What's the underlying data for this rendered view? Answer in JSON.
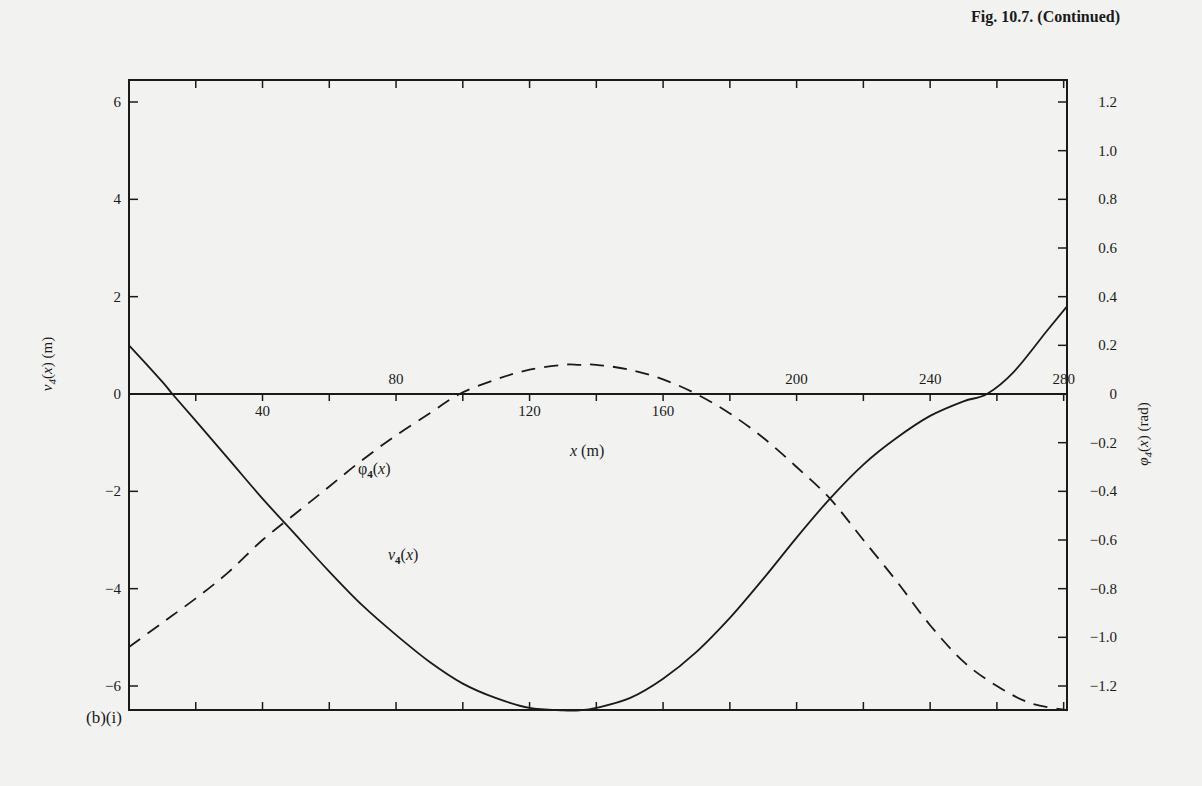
{
  "figure": {
    "caption": "Fig. 10.7. (Continued)",
    "panel_label": "(b)(i)"
  },
  "colors": {
    "ink": "#1a1a1a",
    "paper": "#f2f2f0"
  },
  "chart_data": {
    "type": "line",
    "title": "",
    "xlabel": "x (m)",
    "ylabel": "v4(x) (m)",
    "y2label": "φ4(x) (rad)",
    "xlim": [
      0,
      281
    ],
    "ylim": [
      -6.5,
      6.5
    ],
    "y2lim": [
      -1.3,
      1.3
    ],
    "grid": false,
    "x_ticks": [
      20,
      40,
      60,
      80,
      100,
      120,
      140,
      160,
      180,
      200,
      220,
      240,
      260,
      280
    ],
    "x_tick_labels": [
      {
        "value": 40,
        "text": "40",
        "position": "below"
      },
      {
        "value": 80,
        "text": "80",
        "position": "above"
      },
      {
        "value": 120,
        "text": "120",
        "position": "below"
      },
      {
        "value": 160,
        "text": "160",
        "position": "below"
      },
      {
        "value": 200,
        "text": "200",
        "position": "above"
      },
      {
        "value": 240,
        "text": "240",
        "position": "above"
      },
      {
        "value": 280,
        "text": "280",
        "position": "above"
      }
    ],
    "y_ticks": [
      6,
      4,
      2,
      0,
      -2,
      -4,
      -6
    ],
    "y_tick_labels": [
      "6",
      "4",
      "2",
      "0",
      "−2",
      "−4",
      "−6"
    ],
    "y2_ticks": [
      1.2,
      1.0,
      0.8,
      0.6,
      0.4,
      0.2,
      0,
      -0.2,
      -0.4,
      -0.6,
      -0.8,
      -1.0,
      -1.2
    ],
    "y2_tick_labels": [
      "1.2",
      "1.0",
      "0.8",
      "0.6",
      "0.4",
      "0.2",
      "0",
      "−0.2",
      "−0.4",
      "−0.6",
      "−0.8",
      "−1.0",
      "−1.2"
    ],
    "series": [
      {
        "name": "v4(x)",
        "axis": "left",
        "style": "solid",
        "x": [
          0,
          10,
          13,
          20,
          30,
          40,
          50,
          60,
          70,
          80,
          90,
          100,
          110,
          120,
          130,
          135,
          140,
          150,
          160,
          170,
          180,
          190,
          200,
          210,
          220,
          230,
          240,
          250,
          257,
          265,
          275,
          281
        ],
        "values": [
          1.0,
          0.25,
          0.0,
          -0.55,
          -1.35,
          -2.15,
          -2.9,
          -3.65,
          -4.35,
          -4.95,
          -5.5,
          -5.95,
          -6.25,
          -6.45,
          -6.5,
          -6.5,
          -6.45,
          -6.25,
          -5.85,
          -5.3,
          -4.6,
          -3.8,
          -2.95,
          -2.15,
          -1.45,
          -0.9,
          -0.45,
          -0.15,
          0.0,
          0.45,
          1.3,
          1.8
        ]
      },
      {
        "name": "φ4(x)",
        "axis": "right",
        "style": "dashed",
        "x": [
          0,
          10,
          20,
          30,
          40,
          50,
          60,
          70,
          80,
          90,
          99,
          110,
          120,
          130,
          135,
          140,
          150,
          160,
          170,
          180,
          190,
          200,
          210,
          220,
          230,
          240,
          250,
          260,
          270,
          281
        ],
        "values": [
          -1.04,
          -0.94,
          -0.84,
          -0.73,
          -0.6,
          -0.49,
          -0.38,
          -0.27,
          -0.17,
          -0.08,
          0.0,
          0.06,
          0.1,
          0.12,
          0.12,
          0.12,
          0.1,
          0.06,
          0.0,
          -0.08,
          -0.18,
          -0.3,
          -0.43,
          -0.6,
          -0.77,
          -0.95,
          -1.1,
          -1.2,
          -1.27,
          -1.3
        ]
      }
    ],
    "annotations": [
      {
        "text": "φ4(x)",
        "x": 78,
        "y2": -0.4
      },
      {
        "text": "v4(x)",
        "x": 78,
        "y": -4.6
      },
      {
        "text": "x (m)",
        "x": 130,
        "y": -1.2
      }
    ]
  }
}
